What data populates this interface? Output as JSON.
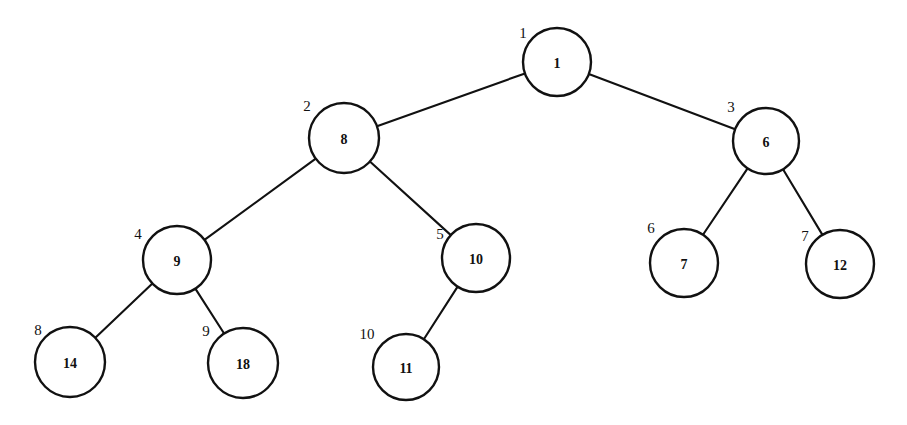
{
  "diagram": {
    "background_color": "#ffffff",
    "stroke_color": "#111111",
    "node_fill_color": "#ffffff"
  },
  "chart_data": {
    "type": "diagram",
    "subtype": "binary-tree",
    "title": "",
    "nodes": [
      {
        "index": "1",
        "value": "1",
        "cx": 557,
        "cy": 62,
        "r": 34,
        "label_x": 523,
        "label_y": 33,
        "parent": null
      },
      {
        "index": "2",
        "value": "8",
        "cx": 344,
        "cy": 138,
        "r": 35,
        "label_x": 307,
        "label_y": 106,
        "parent": "1"
      },
      {
        "index": "3",
        "value": "6",
        "cx": 766,
        "cy": 141,
        "r": 33,
        "label_x": 731,
        "label_y": 107,
        "parent": "1"
      },
      {
        "index": "4",
        "value": "9",
        "cx": 177,
        "cy": 260,
        "r": 34,
        "label_x": 138,
        "label_y": 234,
        "parent": "2"
      },
      {
        "index": "5",
        "value": "10",
        "cx": 476,
        "cy": 258,
        "r": 34,
        "label_x": 440,
        "label_y": 234,
        "parent": "2"
      },
      {
        "index": "6",
        "value": "7",
        "cx": 684,
        "cy": 263,
        "r": 34,
        "label_x": 651,
        "label_y": 228,
        "parent": "3"
      },
      {
        "index": "7",
        "value": "12",
        "cx": 840,
        "cy": 264,
        "r": 34,
        "label_x": 805,
        "label_y": 236,
        "parent": "3"
      },
      {
        "index": "8",
        "value": "14",
        "cx": 70,
        "cy": 362,
        "r": 35,
        "label_x": 38,
        "label_y": 330,
        "parent": "4"
      },
      {
        "index": "9",
        "value": "18",
        "cx": 243,
        "cy": 363,
        "r": 35,
        "label_x": 206,
        "label_y": 331,
        "parent": "4"
      },
      {
        "index": "10",
        "value": "11",
        "cx": 406,
        "cy": 367,
        "r": 33,
        "label_x": 367,
        "label_y": 334,
        "parent": "5"
      }
    ],
    "edges": [
      {
        "from": "1",
        "to": "2"
      },
      {
        "from": "1",
        "to": "3"
      },
      {
        "from": "2",
        "to": "4"
      },
      {
        "from": "2",
        "to": "5"
      },
      {
        "from": "3",
        "to": "6"
      },
      {
        "from": "3",
        "to": "7"
      },
      {
        "from": "4",
        "to": "8"
      },
      {
        "from": "4",
        "to": "9"
      },
      {
        "from": "5",
        "to": "10"
      }
    ]
  }
}
